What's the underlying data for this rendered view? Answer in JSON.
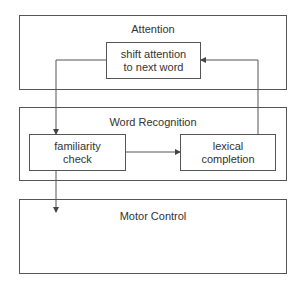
{
  "modules": [
    {
      "id": "attention",
      "title": "Attention"
    },
    {
      "id": "word-recognition",
      "title": "Word Recognition"
    },
    {
      "id": "motor-control",
      "title": "Motor Control"
    }
  ],
  "processes": {
    "shift": "shift attention\nto next word",
    "familiarity": "familiarity\ncheck",
    "lexical": "lexical\ncompletion"
  },
  "colors": {
    "line": "#555555",
    "text": "#333333",
    "background": "#ffffff"
  }
}
